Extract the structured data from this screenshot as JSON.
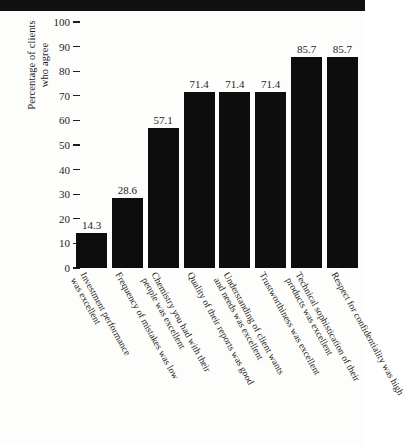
{
  "chart_data": {
    "type": "bar",
    "title": "",
    "xlabel": "",
    "ylabel": "Percentage of clients who agree",
    "ylabel_lines": [
      "Percentage of clients",
      "who agree"
    ],
    "ylim": [
      0,
      100
    ],
    "yticks": [
      0,
      10,
      20,
      30,
      40,
      50,
      60,
      70,
      80,
      90,
      100
    ],
    "ytick_labels": [
      "0",
      "10",
      "20",
      "30",
      "40",
      "50",
      "60",
      "70",
      "80",
      "90",
      "100"
    ],
    "grid": false,
    "legend": null,
    "bar_color": "#0d0d0d",
    "background_color": "#fdfdfc",
    "categories": [
      "Investment performance was excellent",
      "Frequency of mistakes was low",
      "Chemistry you had with their people was excellent",
      "Quality of their reports was good",
      "Understanding of client wants and needs was excellent",
      "Trustworthiness was excellent",
      "Technical sophistication of their products was excellent",
      "Respect for confidentiality was high"
    ],
    "category_lines": [
      [
        "Investment performance",
        "was excellent"
      ],
      [
        "Frequency of mistakes was low"
      ],
      [
        "Chemistry you had with their",
        "people was excellent"
      ],
      [
        "Quality of their reports was good"
      ],
      [
        "Understanding of client wants",
        "and needs was excellent"
      ],
      [
        "Trustworthiness was excellent"
      ],
      [
        "Technical sophistication of their",
        "products was excellent"
      ],
      [
        "Respect for confidentiality was high"
      ]
    ],
    "values": [
      14.3,
      28.6,
      57.1,
      71.4,
      71.4,
      71.4,
      85.7,
      85.7
    ],
    "value_labels": [
      "14.3",
      "28.6",
      "57.1",
      "71.4",
      "71.4",
      "71.4",
      "85.7",
      "85.7"
    ]
  }
}
